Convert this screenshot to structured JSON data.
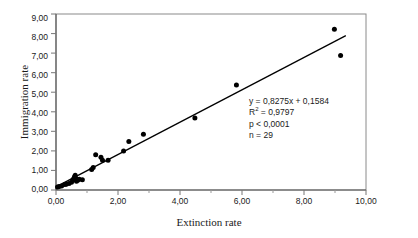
{
  "chart_data": {
    "type": "scatter",
    "title": "",
    "xlabel": "Extinction rate",
    "ylabel": "Immigration rate",
    "xlim": [
      0,
      10
    ],
    "ylim": [
      0,
      9
    ],
    "grid": false,
    "legend": null,
    "xticklabels": [
      "0,00",
      "2,00",
      "4,00",
      "6,00",
      "8,00",
      "10,00"
    ],
    "xtickvalues": [
      0,
      2,
      4,
      6,
      8,
      10
    ],
    "xminorticks": [
      1,
      3,
      5,
      7,
      9
    ],
    "yticklabels": [
      "0,00",
      "1,00",
      "2,00",
      "3,00",
      "4,00",
      "5,00",
      "6,00",
      "7,00",
      "8,00",
      "9,00"
    ],
    "ytickvalues": [
      0,
      1,
      2,
      3,
      4,
      5,
      6,
      7,
      8,
      9
    ],
    "marker": "filled-circle",
    "marker_color": "#000000",
    "line_color": "#000000",
    "points": [
      [
        0.05,
        0.15
      ],
      [
        0.18,
        0.2
      ],
      [
        0.28,
        0.28
      ],
      [
        0.33,
        0.3
      ],
      [
        0.42,
        0.33
      ],
      [
        0.5,
        0.4
      ],
      [
        0.55,
        0.52
      ],
      [
        0.58,
        0.6
      ],
      [
        0.6,
        0.68
      ],
      [
        0.62,
        0.75
      ],
      [
        0.64,
        0.6
      ],
      [
        0.66,
        0.45
      ],
      [
        0.7,
        0.5
      ],
      [
        0.75,
        0.55
      ],
      [
        0.85,
        0.52
      ],
      [
        1.15,
        1.05
      ],
      [
        1.2,
        1.15
      ],
      [
        1.28,
        1.8
      ],
      [
        1.45,
        1.68
      ],
      [
        1.5,
        1.52
      ],
      [
        1.68,
        1.52
      ],
      [
        2.18,
        2.0
      ],
      [
        2.35,
        2.48
      ],
      [
        2.82,
        2.85
      ],
      [
        4.48,
        3.68
      ],
      [
        5.82,
        5.37
      ],
      [
        8.98,
        8.22
      ],
      [
        9.18,
        6.88
      ],
      [
        0.1,
        0.18
      ]
    ],
    "fit_line": {
      "slope": 0.8275,
      "intercept": 0.1584,
      "x_start": 0.0,
      "x_end": 9.35
    },
    "annotations": {
      "equation": "y = 0,8275x + 0,1584",
      "r_squared_prefix": "R",
      "r_squared_sup": "2",
      "r_squared_value": " = 0,9797",
      "pvalue": "p < 0,0001",
      "n": "n = 29"
    }
  }
}
